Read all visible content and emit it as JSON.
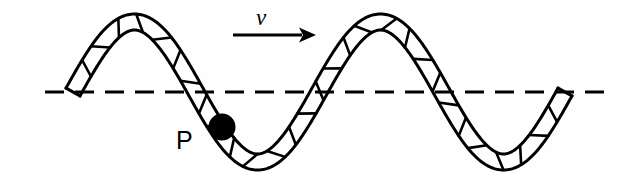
{
  "figure": {
    "background_color": "#fefefe",
    "stroke_color": "#000000",
    "width": 636,
    "height": 172
  },
  "labels": {
    "velocity": "v",
    "point": "P"
  },
  "arrow": {
    "name": "velocity-arrow",
    "direction": "right",
    "x_start": 233,
    "x_end": 316,
    "y": 35
  },
  "axis": {
    "name": "equilibrium-dashed-line",
    "y": 92,
    "x_start": 45,
    "x_end": 614,
    "dash": "19 11",
    "stroke_width": 3.2,
    "color": "#000000"
  },
  "marker": {
    "name": "point-p-marker",
    "cx": 222,
    "cy": 127,
    "r": 13.5,
    "fill": "#000000"
  },
  "chart_data": {
    "type": "line",
    "xlabel": "",
    "ylabel": "",
    "grid": false,
    "legend": null,
    "xlim": [
      45,
      614
    ],
    "ylim": [
      172,
      0
    ],
    "annotations": [
      {
        "text": "v",
        "x": 265,
        "y": 22,
        "note": "wave propagation speed, arrow points right"
      },
      {
        "text": "P",
        "x": 183,
        "y": 148,
        "note": "label for marked particle on the rope"
      }
    ],
    "series": [
      {
        "name": "rope-centerline",
        "description": "Sinusoidal rope shape, two full crests and two troughs, drawn as a hatched ribbon",
        "amplitude": 70,
        "wavelength": 246,
        "equilibrium_y": 92,
        "x_start": 73,
        "x_end": 565,
        "key_points": [
          {
            "x": 73,
            "y": 92,
            "kind": "zero-crossing-rising"
          },
          {
            "x": 135,
            "y": 22,
            "kind": "crest"
          },
          {
            "x": 199,
            "y": 92,
            "kind": "zero-crossing-falling"
          },
          {
            "x": 256,
            "y": 160,
            "kind": "trough"
          },
          {
            "x": 320,
            "y": 92,
            "kind": "zero-crossing-rising"
          },
          {
            "x": 390,
            "y": 26,
            "kind": "crest"
          },
          {
            "x": 450,
            "y": 92,
            "kind": "zero-crossing-falling"
          },
          {
            "x": 506,
            "y": 162,
            "kind": "trough"
          },
          {
            "x": 565,
            "y": 92,
            "kind": "zero-crossing-rising"
          }
        ]
      },
      {
        "name": "marked-point-P",
        "description": "Filled black circle on the descending segment of the rope, below equilibrium",
        "x": 222,
        "y": 127
      }
    ],
    "ribbon": {
      "half_width_px": 8,
      "hatch_count": 30,
      "hatch_note": "short slanted cross lines connecting the two rope edges, evenly spaced along the arc"
    }
  }
}
